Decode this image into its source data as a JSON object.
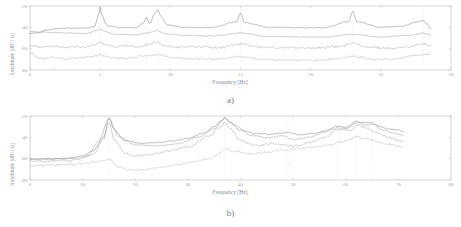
{
  "figure": {
    "panels": [
      {
        "caption": "a)",
        "chart_data": {
          "type": "line",
          "title": "",
          "xlabel": "Frequency [Hz]",
          "ylabel": "Amplitude [dB/1 u]",
          "xlim": [
            0,
            30
          ],
          "ylim": [
            -80,
            -20
          ],
          "xticks": [
            0,
            5,
            10,
            15,
            20,
            25,
            30
          ],
          "yticks": [
            -20,
            -40,
            -60,
            -80
          ],
          "grid": false,
          "legend": "none",
          "peaks_hz": [
            5.0,
            8.3,
            9.1,
            15.0,
            23.0,
            28.0
          ],
          "series": [
            {
              "name": "curve-1",
              "color": "#7d7d7d",
              "x": [
                0,
                0.6,
                1.2,
                2,
                3,
                4,
                4.6,
                4.9,
                5.0,
                5.1,
                5.5,
                6.5,
                7.5,
                8.1,
                8.3,
                8.5,
                8.9,
                9.1,
                9.3,
                9.8,
                11,
                13,
                14.7,
                15.0,
                15.3,
                17,
                19,
                21,
                22.7,
                23.0,
                23.3,
                25,
                26.5,
                27.6,
                28.0,
                28.6
              ],
              "y": [
                -45.5,
                -45.0,
                -42.5,
                -41.0,
                -40.7,
                -40.6,
                -39.5,
                -28.0,
                -21.5,
                -28.5,
                -38.5,
                -40.3,
                -40.4,
                -36.0,
                -30.5,
                -36.5,
                -27.0,
                -23.5,
                -29.5,
                -38.0,
                -40.0,
                -40.0,
                -35.0,
                -27.0,
                -35.5,
                -40.0,
                -40.3,
                -40.4,
                -34.5,
                -25.5,
                -34.8,
                -40.0,
                -39.0,
                -35.0,
                -33.5,
                -41.0
              ]
            },
            {
              "name": "curve-2",
              "color": "#9b9b9b",
              "x": [
                0,
                1,
                2,
                3,
                4,
                4.9,
                5.0,
                5.2,
                6,
                7.5,
                8.3,
                8.8,
                9.1,
                9.6,
                11,
                13,
                15.0,
                17,
                19,
                21,
                23.0,
                25,
                27,
                28.0,
                28.6
              ],
              "y": [
                -44.0,
                -44.5,
                -45.0,
                -45.5,
                -45.8,
                -42.5,
                -41.0,
                -43.5,
                -46.5,
                -47.0,
                -45.5,
                -44.0,
                -43.0,
                -46.0,
                -47.5,
                -48.0,
                -45.5,
                -48.5,
                -49.0,
                -49.2,
                -46.5,
                -49.0,
                -47.5,
                -45.5,
                -47.0
              ]
            },
            {
              "name": "curve-3",
              "color": "#a8a8a8",
              "x": [
                0,
                0.8,
                1.6,
                2.4,
                3.2,
                4,
                4.6,
                5.0,
                5.4,
                6.2,
                7,
                7.8,
                8.4,
                9.0,
                9.6,
                10.5,
                12,
                13.5,
                15.0,
                16.5,
                18,
                20,
                22,
                23.0,
                24,
                25.5,
                27,
                28.0,
                28.6
              ],
              "y": [
                -57.0,
                -58.5,
                -57.5,
                -59.0,
                -57.8,
                -58.5,
                -56.0,
                -53.5,
                -56.5,
                -58.0,
                -57.0,
                -58.5,
                -56.0,
                -54.0,
                -57.5,
                -58.5,
                -58.0,
                -59.0,
                -55.5,
                -58.5,
                -59.0,
                -59.5,
                -58.0,
                -55.0,
                -58.5,
                -59.5,
                -58.0,
                -55.5,
                -57.0
              ]
            },
            {
              "name": "curve-4",
              "color": "#b4b4b4",
              "x": [
                0,
                0.7,
                1.5,
                2.5,
                3.5,
                4.5,
                5.0,
                5.8,
                7,
                8.3,
                9.1,
                10,
                11.5,
                13,
                15.0,
                16.5,
                18,
                20,
                22,
                23.0,
                24.5,
                26,
                27.5,
                28.6
              ],
              "y": [
                -64.0,
                -69.0,
                -68.0,
                -69.5,
                -68.5,
                -67.5,
                -66.0,
                -68.5,
                -69.0,
                -66.5,
                -65.5,
                -68.0,
                -69.5,
                -70.0,
                -67.5,
                -70.0,
                -70.5,
                -71.0,
                -69.5,
                -67.0,
                -70.0,
                -69.5,
                -66.5,
                -65.0
              ]
            }
          ]
        }
      },
      {
        "caption": "b)",
        "chart_data": {
          "type": "line",
          "title": "",
          "xlabel": "Frequency [Hz]",
          "ylabel": "Amplitude [dB/1 u]",
          "xlim": [
            0,
            80
          ],
          "ylim": [
            -80,
            -20
          ],
          "xticks": [
            0,
            10,
            20,
            30,
            40,
            50,
            60,
            70,
            80
          ],
          "yticks": [
            -20,
            -40,
            -60,
            -80
          ],
          "grid": false,
          "legend": "none",
          "peaks_hz": [
            15.0,
            37.0,
            49.0,
            58.5,
            62.0,
            65.0
          ],
          "series": [
            {
              "name": "curve-1",
              "color": "#7d7d7d",
              "x": [
                0,
                2,
                4,
                6,
                8,
                10,
                12,
                14,
                15.0,
                16,
                18,
                21,
                24,
                27,
                30,
                33,
                35,
                36.5,
                37.0,
                38,
                40,
                43,
                46,
                49,
                51,
                54,
                56,
                58.5,
                60,
                62.0,
                63,
                65.0,
                66.5,
                68,
                70,
                71
              ],
              "y": [
                -60.0,
                -60.2,
                -60.0,
                -59.8,
                -59.0,
                -57.5,
                -52.5,
                -40.0,
                -21.5,
                -33.0,
                -43.0,
                -45.5,
                -45.0,
                -43.5,
                -41.0,
                -36.0,
                -30.0,
                -24.0,
                -21.5,
                -26.0,
                -33.5,
                -36.5,
                -37.0,
                -35.5,
                -37.5,
                -36.5,
                -34.0,
                -29.5,
                -30.5,
                -25.0,
                -26.0,
                -26.5,
                -30.0,
                -32.0,
                -33.0,
                -34.5
              ]
            },
            {
              "name": "curve-2",
              "color": "#9b9b9b",
              "x": [
                0,
                3,
                6,
                9,
                11,
                13,
                15.0,
                17,
                20,
                24,
                28,
                32,
                35,
                37.0,
                39,
                42,
                45,
                48,
                50,
                53,
                56,
                58.5,
                60,
                62.0,
                64,
                65.0,
                67,
                69,
                71
              ],
              "y": [
                -60.5,
                -60.5,
                -60.3,
                -59.5,
                -57.0,
                -44.0,
                -23.0,
                -40.0,
                -47.0,
                -48.0,
                -46.0,
                -40.0,
                -32.0,
                -22.5,
                -29.0,
                -38.0,
                -40.5,
                -38.5,
                -42.0,
                -40.0,
                -35.0,
                -31.0,
                -32.0,
                -26.5,
                -28.5,
                -27.5,
                -33.0,
                -36.0,
                -38.0
              ]
            },
            {
              "name": "curve-3",
              "color": "#a8a8a8",
              "x": [
                0,
                3,
                6,
                9,
                12,
                14,
                15.0,
                16,
                18,
                20,
                23,
                26,
                30,
                34,
                36,
                37.0,
                38,
                40,
                43,
                46,
                48,
                50,
                53,
                56,
                58.5,
                61,
                62.0,
                64,
                66,
                68,
                70,
                71
              ],
              "y": [
                -62.5,
                -62.5,
                -62.0,
                -61.5,
                -56.0,
                -42.0,
                -26.0,
                -42.5,
                -55.0,
                -57.5,
                -56.0,
                -53.0,
                -49.0,
                -39.0,
                -31.0,
                -26.0,
                -32.0,
                -43.0,
                -48.0,
                -46.0,
                -47.0,
                -48.5,
                -45.0,
                -40.0,
                -32.5,
                -33.0,
                -28.5,
                -31.0,
                -36.0,
                -40.0,
                -43.0,
                -44.0
              ]
            },
            {
              "name": "curve-4",
              "color": "#bcbcbc",
              "x": [
                0,
                4,
                8,
                10,
                12,
                14,
                15.0,
                17,
                19,
                22,
                25,
                28,
                31,
                34,
                36,
                37.0,
                39,
                42,
                45,
                48,
                51,
                54,
                57,
                59,
                61,
                62.0,
                64,
                66,
                68,
                70,
                71
              ],
              "y": [
                -66.5,
                -66.0,
                -65.5,
                -64.5,
                -63.0,
                -62.0,
                -60.5,
                -68.0,
                -71.0,
                -70.0,
                -68.0,
                -65.5,
                -63.0,
                -60.0,
                -55.5,
                -51.0,
                -53.0,
                -55.5,
                -54.0,
                -52.0,
                -50.5,
                -49.0,
                -47.0,
                -44.5,
                -42.0,
                -39.5,
                -41.5,
                -44.0,
                -46.5,
                -48.5,
                -49.5
              ]
            }
          ]
        }
      }
    ]
  }
}
